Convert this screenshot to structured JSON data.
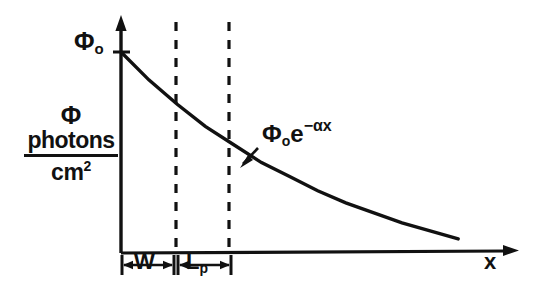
{
  "figure": {
    "title_visible": false,
    "background_color": "#ffffff",
    "ink_color": "#111111",
    "axes": {
      "y_axis": {
        "name": "flux-axis",
        "label_phi": "Φ",
        "label_numerator": "photons",
        "label_denominator": "cm",
        "label_denominator_exponent": "2",
        "origin_tick_label": "Φ",
        "origin_tick_subscript": "o",
        "has_arrowhead": true
      },
      "x_axis": {
        "name": "distance-axis",
        "label": "x",
        "has_arrowhead": true
      }
    },
    "annotations": {
      "curve_equation_base": "Φ",
      "curve_equation_subscript": "o",
      "curve_equation_factor": "e",
      "curve_equation_exponent": "−αx",
      "region_1_label": "W",
      "region_2_label": "L",
      "region_2_label_subscript": "p"
    }
  },
  "chart_data": {
    "type": "line",
    "title": "",
    "xlabel": "x",
    "ylabel": "Φ photons/cm^2",
    "grid": false,
    "legend": null,
    "series": [
      {
        "name": "Φ₀e^(-αx)",
        "equation": "phi = phi_0 * exp(-alpha * x)",
        "x": [
          0.0,
          0.15,
          0.3,
          0.45,
          0.6,
          0.75,
          0.9,
          1.05,
          1.2,
          1.35,
          1.5,
          1.65,
          1.8
        ],
        "y": [
          1.0,
          0.86,
          0.74,
          0.63,
          0.54,
          0.45,
          0.38,
          0.31,
          0.25,
          0.2,
          0.15,
          0.11,
          0.07
        ]
      }
    ],
    "xlim": [
      0,
      2.05
    ],
    "ylim": [
      0,
      1.12
    ],
    "y_tick_labels": [
      "Φₒ"
    ],
    "y_tick_values": [
      1.0
    ],
    "x_tick_labels": [],
    "vertical_markers": [
      {
        "label": "W boundary",
        "x": 0.47
      },
      {
        "label": "Lp boundary",
        "x": 0.93
      }
    ],
    "spans": [
      {
        "label": "W",
        "x_start": 0.0,
        "x_end": 0.47
      },
      {
        "label": "Lp",
        "x_start": 0.47,
        "x_end": 0.93
      }
    ]
  }
}
